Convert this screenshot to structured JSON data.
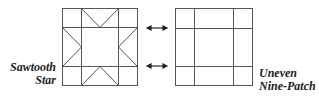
{
  "figure": {
    "left_block": {
      "name": "Sawtooth Star",
      "label_lines": [
        "Sawtooth",
        "Star"
      ]
    },
    "right_block": {
      "name": "Uneven Nine-Patch",
      "label_lines": [
        "Uneven",
        "Nine-Patch"
      ]
    },
    "connectors": [
      {
        "type": "double-arrow",
        "row": "top"
      },
      {
        "type": "double-arrow",
        "row": "bottom"
      }
    ],
    "colors": {
      "line": "#555555",
      "arrow": "#222222",
      "background": "#ffffff"
    }
  }
}
